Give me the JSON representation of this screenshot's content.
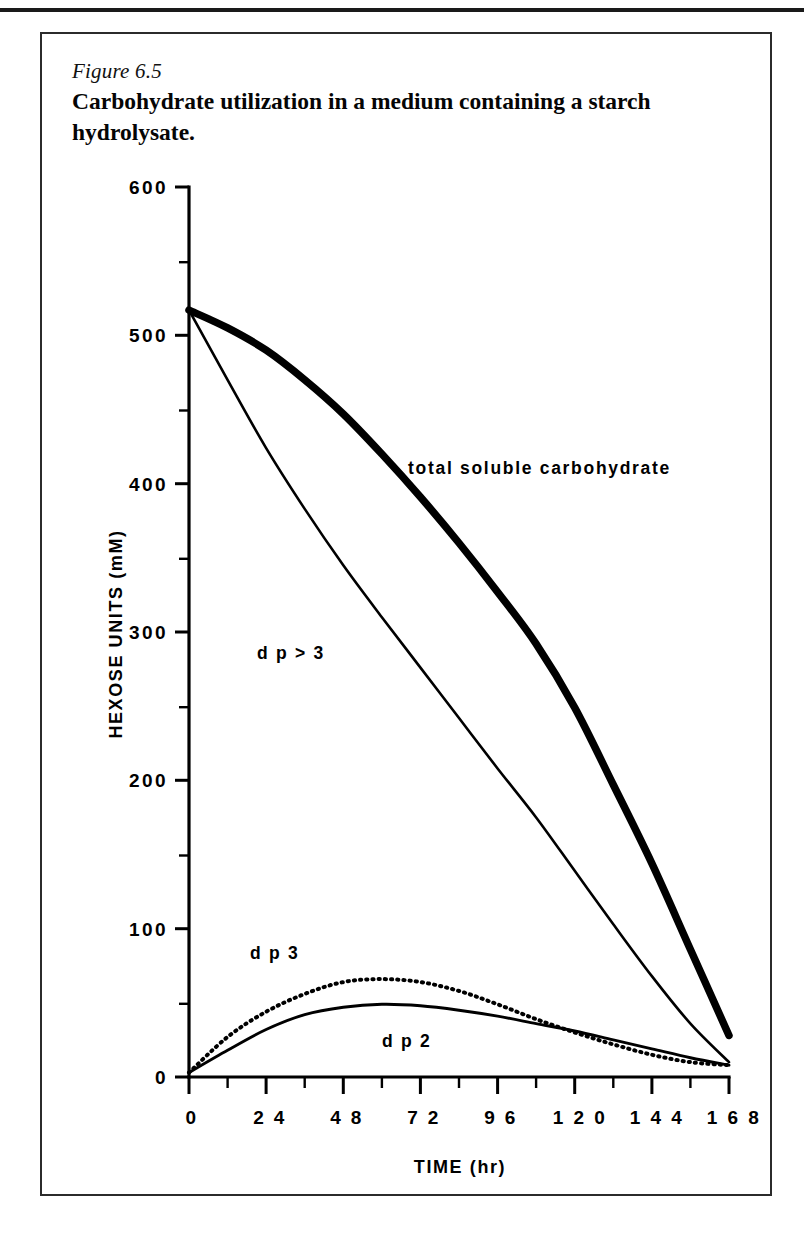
{
  "page": {
    "figure_number": "Figure 6.5",
    "caption": "Carbohydrate utilization in a medium containing a starch hydrolysate."
  },
  "chart_data": {
    "type": "line",
    "title": "Carbohydrate utilization in a medium containing a starch hydrolysate.",
    "xlabel": "TIME (hr)",
    "ylabel": "HEXOSE UNITS (mM)",
    "xlim": [
      0,
      168
    ],
    "ylim": [
      0,
      600
    ],
    "xticks": [
      0,
      24,
      48,
      72,
      96,
      120,
      144,
      168
    ],
    "xtick_labels": [
      "0",
      "2 4",
      "4 8",
      "7 2",
      "9 6",
      "1 2 0",
      "1 4 4",
      "1 6 8"
    ],
    "xminor_step": 12,
    "yticks": [
      0,
      100,
      200,
      300,
      400,
      500,
      600
    ],
    "ytick_labels": [
      "0",
      "100",
      "200",
      "300",
      "400",
      "500",
      "600"
    ],
    "yminor_step": 50,
    "grid": false,
    "legend": "inline-annotations",
    "series": [
      {
        "name": "total soluble carbohydrate",
        "label": "total  soluble  carbohydrate",
        "style": "thick-solid",
        "x": [
          0,
          12,
          24,
          36,
          48,
          60,
          72,
          84,
          96,
          108,
          120,
          132,
          144,
          156,
          168
        ],
        "values": [
          517,
          505,
          490,
          470,
          447,
          420,
          391,
          360,
          327,
          292,
          249,
          197,
          144,
          86,
          28
        ]
      },
      {
        "name": "dp>3",
        "label": "d p > 3",
        "style": "thin-solid",
        "x": [
          0,
          12,
          24,
          36,
          48,
          60,
          72,
          84,
          96,
          108,
          120,
          132,
          144,
          156,
          168
        ],
        "values": [
          517,
          470,
          424,
          383,
          345,
          310,
          276,
          242,
          208,
          175,
          139,
          103,
          68,
          36,
          10
        ]
      },
      {
        "name": "dp3",
        "label": "d p 3",
        "style": "dotted",
        "x": [
          0,
          12,
          24,
          36,
          48,
          60,
          72,
          84,
          96,
          108,
          120,
          132,
          144,
          156,
          168
        ],
        "values": [
          3,
          27,
          44,
          56,
          64,
          66,
          64,
          58,
          49,
          39,
          30,
          22,
          15,
          10,
          8
        ]
      },
      {
        "name": "dp2",
        "label": "d p 2",
        "style": "solid",
        "x": [
          0,
          12,
          24,
          36,
          48,
          60,
          72,
          84,
          96,
          108,
          120,
          132,
          144,
          156,
          168
        ],
        "values": [
          3,
          18,
          32,
          42,
          47,
          49,
          48,
          45,
          41,
          36,
          31,
          25,
          19,
          13,
          8
        ]
      }
    ],
    "annotations": [
      {
        "text": "total  soluble  carbohydrate",
        "x": 68,
        "y": 432
      },
      {
        "text": "d p > 3",
        "x": 20,
        "y": 292
      },
      {
        "text": "d p 3",
        "x": 17,
        "y": 92
      },
      {
        "text": "d p 2",
        "x": 58,
        "y": 31
      }
    ]
  }
}
